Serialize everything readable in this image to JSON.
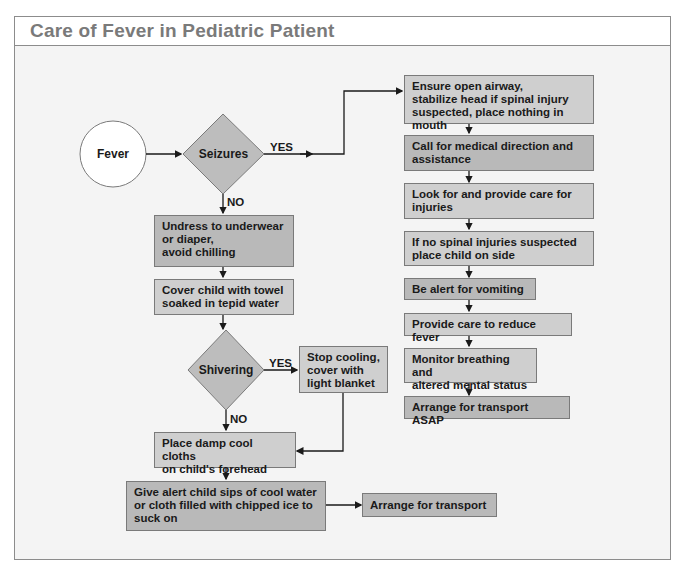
{
  "title": "Care of Fever in Pediatric Patient",
  "colors": {
    "frame_border": "#8c8c8c",
    "background": "#f4f4f4",
    "box_fill": "#cfcfcf",
    "box_fill_dark": "#b9b9b9",
    "title_text": "#7a7a7a"
  },
  "nodes": {
    "start": "Fever",
    "seizures": "Seizures",
    "shivering": "Shivering"
  },
  "branch_labels": {
    "seizures_yes": "YES",
    "seizures_no": "NO",
    "shivering_yes": "YES",
    "shivering_no": "NO"
  },
  "left_steps": [
    {
      "id": "undress",
      "lines": [
        "Undress to underwear",
        "or diaper,",
        "avoid chilling"
      ]
    },
    {
      "id": "cover_towel",
      "lines": [
        "Cover child with towel",
        "soaked in tepid water"
      ]
    },
    {
      "id": "stop_cooling",
      "lines": [
        "Stop cooling,",
        "cover with",
        "light blanket"
      ]
    },
    {
      "id": "damp_cloths",
      "lines": [
        "Place damp cool cloths",
        "on child's forehead"
      ]
    },
    {
      "id": "sips",
      "lines": [
        "Give alert child sips of cool water",
        "or cloth filled with chipped ice to",
        "suck on"
      ]
    },
    {
      "id": "transport",
      "lines": [
        "Arrange for transport"
      ]
    }
  ],
  "right_steps": [
    {
      "id": "airway",
      "lines": [
        "Ensure open airway,",
        "stabilize head if spinal injury",
        "suspected, place nothing in mouth"
      ]
    },
    {
      "id": "call",
      "lines": [
        "Call for medical direction and",
        "assistance"
      ]
    },
    {
      "id": "injuries",
      "lines": [
        "Look for and provide care for",
        "injuries"
      ]
    },
    {
      "id": "side",
      "lines": [
        "If no spinal injuries suspected",
        "place child on side"
      ]
    },
    {
      "id": "vomiting",
      "lines": [
        "Be alert for vomiting"
      ]
    },
    {
      "id": "reduce_fever",
      "lines": [
        "Provide care to reduce fever"
      ]
    },
    {
      "id": "monitor",
      "lines": [
        "Monitor breathing and",
        "altered mental status"
      ]
    },
    {
      "id": "transport_asap",
      "lines": [
        "Arrange for transport ASAP"
      ]
    }
  ]
}
